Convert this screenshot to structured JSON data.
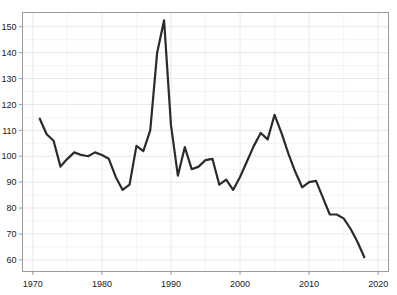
{
  "chart_data": {
    "type": "line",
    "title": "",
    "xlabel": "",
    "ylabel": "",
    "xlim": [
      1968.5,
      2021.5
    ],
    "ylim": [
      55.5,
      155.5
    ],
    "grid": true,
    "grid_major_color": "#e8e8ec",
    "grid_minor_color": "#f4f4f7",
    "legend": "none",
    "line_color": "#2b2b2b",
    "line_width": 2.2,
    "axis_color": "#9a9a9a",
    "background": "#ffffff",
    "xticks": [
      1970,
      1980,
      1990,
      2000,
      2010,
      2020
    ],
    "xtick_labels": [
      "1970",
      "1980",
      "1990",
      "2000",
      "2010",
      "2020"
    ],
    "xticks_minor": [
      1975,
      1985,
      1995,
      2005,
      2015
    ],
    "yticks": [
      60,
      70,
      80,
      90,
      100,
      110,
      120,
      130,
      140,
      150
    ],
    "ytick_labels": [
      "60",
      "70",
      "80",
      "90",
      "100",
      "110",
      "120",
      "130",
      "140",
      "150"
    ],
    "yticks_minor": [
      65,
      75,
      85,
      95,
      105,
      115,
      125,
      135,
      145
    ],
    "series": [
      {
        "name": "series-1",
        "x": [
          1971,
          1972,
          1973,
          1974,
          1975,
          1976,
          1977,
          1978,
          1979,
          1980,
          1981,
          1982,
          1983,
          1984,
          1985,
          1986,
          1987,
          1988,
          1989,
          1990,
          1991,
          1992,
          1993,
          1994,
          1995,
          1996,
          1997,
          1998,
          1999,
          2000,
          2001,
          2002,
          2003,
          2004,
          2005,
          2006,
          2007,
          2008,
          2009,
          2010,
          2011,
          2012,
          2013,
          2014,
          2015,
          2016,
          2017,
          2018
        ],
        "values": [
          114.5,
          108.5,
          106.0,
          96.0,
          99.0,
          101.5,
          100.5,
          100.0,
          101.5,
          100.5,
          99.0,
          92.0,
          87.0,
          89.0,
          104.0,
          102.0,
          110.0,
          140.0,
          152.5,
          112.0,
          92.5,
          103.5,
          95.0,
          96.0,
          98.5,
          99.0,
          89.0,
          91.0,
          87.0,
          92.0,
          98.0,
          104.0,
          109.0,
          106.5,
          116.0,
          109.0,
          101.0,
          94.0,
          88.0,
          90.0,
          90.5,
          84.0,
          77.5,
          77.5,
          76.0,
          72.0,
          67.0,
          61.0
        ]
      }
    ]
  },
  "axes": {
    "left_label": "",
    "bottom_label": ""
  }
}
